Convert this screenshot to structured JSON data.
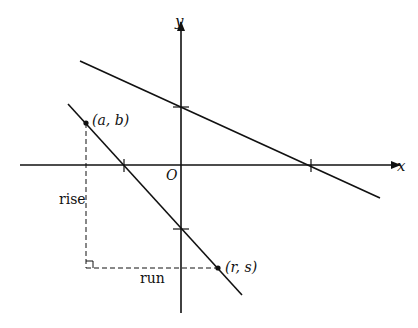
{
  "diagram": {
    "axes": {
      "x_label": "x",
      "y_label": "y",
      "origin_label": "O"
    },
    "points": {
      "p1": {
        "label": "(a, b)"
      },
      "p2": {
        "label": "(r, s)"
      }
    },
    "annotations": {
      "rise": "rise",
      "run": "run"
    },
    "colors": {
      "line": "#111111",
      "background": "#ffffff"
    }
  }
}
